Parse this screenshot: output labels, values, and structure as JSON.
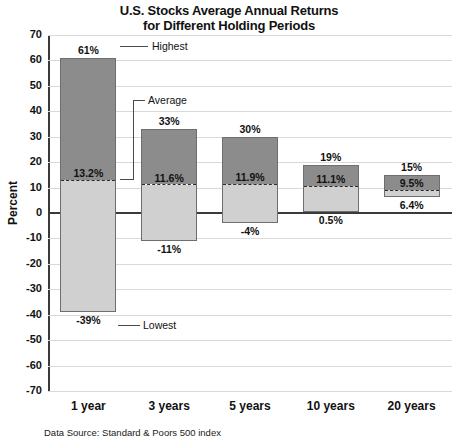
{
  "chart_data": {
    "type": "bar",
    "title": "U.S. Stocks Average Annual Returns for Different Holding Periods",
    "title_line1": "U.S. Stocks Average Annual Returns",
    "title_line2": "for Different Holding Periods",
    "xlabel": "",
    "ylabel": "Percent",
    "ylim": [
      -70,
      70
    ],
    "ytick_step": 10,
    "yticks": [
      70,
      60,
      50,
      40,
      30,
      20,
      10,
      0,
      -10,
      -20,
      -30,
      -40,
      -50,
      -60,
      -70
    ],
    "grid": true,
    "legend": "none",
    "source_note": "Data Source: Standard & Poors 500 index",
    "categories": [
      "1 year",
      "3 years",
      "5 years",
      "10 years",
      "20 years"
    ],
    "series": [
      {
        "name": "Highest",
        "values": [
          61,
          33,
          30,
          19,
          15
        ]
      },
      {
        "name": "Average",
        "values": [
          13.2,
          11.6,
          11.9,
          11.1,
          9.5
        ]
      },
      {
        "name": "Lowest",
        "values": [
          -39,
          -11,
          -4,
          0.5,
          6.4
        ]
      }
    ],
    "bars": [
      {
        "category": "1 year",
        "high": 61,
        "avg": 13.2,
        "low": -39,
        "high_label": "61%",
        "avg_label": "13.2%",
        "low_label": "-39%"
      },
      {
        "category": "3 years",
        "high": 33,
        "avg": 11.6,
        "low": -11,
        "high_label": "33%",
        "avg_label": "11.6%",
        "low_label": "-11%"
      },
      {
        "category": "5 years",
        "high": 30,
        "avg": 11.9,
        "low": -4,
        "high_label": "30%",
        "avg_label": "11.9%",
        "low_label": "-4%"
      },
      {
        "category": "10 years",
        "high": 19,
        "avg": 11.1,
        "low": 0.5,
        "high_label": "19%",
        "avg_label": "11.1%",
        "low_label": "0.5%"
      },
      {
        "category": "20 years",
        "high": 15,
        "avg": 9.5,
        "low": 6.4,
        "high_label": "15%",
        "avg_label": "9.5%",
        "low_label": "6.4%"
      }
    ],
    "annotations": [
      {
        "name": "highest",
        "text": "Highest"
      },
      {
        "name": "average",
        "text": "Average"
      },
      {
        "name": "lowest",
        "text": "Lowest"
      }
    ],
    "colors": {
      "bar_above_average": "#8c8c8c",
      "bar_below_average": "#d0d0d0",
      "bar_border": "#6e6e6e",
      "gridline": "#d9d9d9",
      "axis": "#3a3a3a",
      "text": "#111111",
      "background": "#ffffff"
    }
  }
}
